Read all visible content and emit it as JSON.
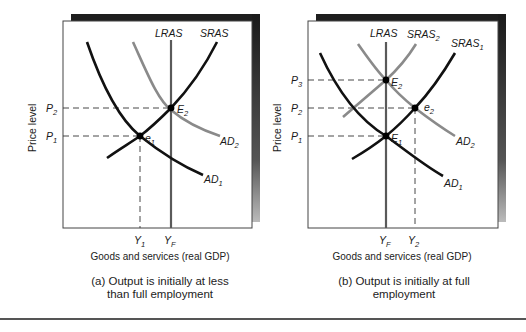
{
  "panels": [
    {
      "id": "a",
      "ylabel": "Price level",
      "xlabel": "Goods and services (real GDP)",
      "caption_line1": "(a) Output is initially at less",
      "caption_line2": "than full employment",
      "curve_labels": {
        "lras": "LRAS",
        "sras": "SRAS",
        "ad1": "AD",
        "ad1_sub": "1",
        "ad2": "AD",
        "ad2_sub": "2"
      },
      "points": {
        "e1": "e",
        "e1_sub": "1",
        "E2": "E",
        "E2_sub": "2"
      },
      "price_ticks": [
        {
          "label": "P",
          "sub": "2"
        },
        {
          "label": "P",
          "sub": "1"
        }
      ],
      "output_ticks": [
        {
          "label": "Y",
          "sub": "1"
        },
        {
          "label": "Y",
          "sub": "F"
        }
      ]
    },
    {
      "id": "b",
      "ylabel": "Price level",
      "xlabel": "Goods and services (real GDP)",
      "caption_line1": "(b) Output is initially at full",
      "caption_line2": "employment",
      "curve_labels": {
        "lras": "LRAS",
        "sras2": "SRAS",
        "sras2_sub": "2",
        "sras1": "SRAS",
        "sras1_sub": "1",
        "ad1": "AD",
        "ad1_sub": "1",
        "ad2": "AD",
        "ad2_sub": "2"
      },
      "points": {
        "E1": "E",
        "E1_sub": "1",
        "E2": "E",
        "E2_sub": "2",
        "e2": "e",
        "e2_sub": "2"
      },
      "price_ticks": [
        {
          "label": "P",
          "sub": "3"
        },
        {
          "label": "P",
          "sub": "2"
        },
        {
          "label": "P",
          "sub": "1"
        }
      ],
      "output_ticks": [
        {
          "label": "Y",
          "sub": "F"
        },
        {
          "label": "Y",
          "sub": "2"
        }
      ]
    }
  ],
  "colors": {
    "dark_curve": "#111111",
    "gray_curve": "#8a8a8a",
    "lras": "#5a5a5a",
    "shadow": "#222222"
  }
}
